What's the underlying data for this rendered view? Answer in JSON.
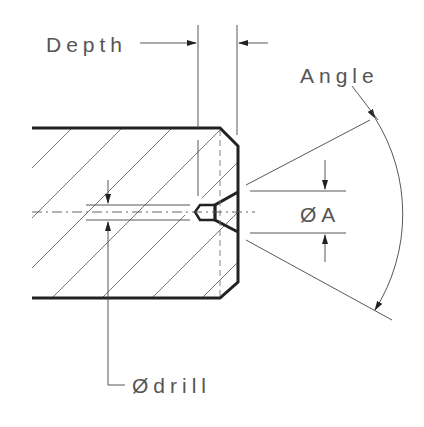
{
  "diagram": {
    "type": "engineering-drawing",
    "labels": {
      "depth": "Depth",
      "angle": "Angle",
      "diameter_a": "ØA",
      "diameter_drill": "Ødrill"
    },
    "colors": {
      "line": "#222222",
      "text": "#555555",
      "background": "#ffffff"
    }
  }
}
